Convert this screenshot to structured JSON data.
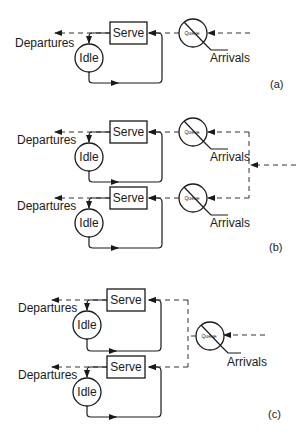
{
  "figure": {
    "labels": {
      "departures": "Departures",
      "arrivals": "Arrivals",
      "serve": "Serve",
      "idle": "Idle",
      "queue": "Queue"
    },
    "panels": [
      {
        "id": "a",
        "label": "(a)",
        "description": "Single server with its own queue"
      },
      {
        "id": "b",
        "label": "(b)",
        "description": "Two servers, each with its own queue, arrivals split"
      },
      {
        "id": "c",
        "label": "(c)",
        "description": "Two servers sharing a single queue"
      }
    ]
  }
}
